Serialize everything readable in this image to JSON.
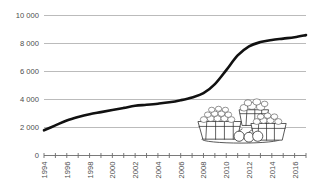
{
  "chart_data": {
    "type": "line",
    "title": "",
    "subtitle": "",
    "xlabel": "",
    "ylabel": "",
    "grid": true,
    "legend": "none",
    "xlim": [
      1994,
      2017
    ],
    "ylim": [
      0,
      10000
    ],
    "y_ticks": [
      0,
      2000,
      4000,
      6000,
      8000,
      10000
    ],
    "y_tick_labels": [
      "0",
      "2 000",
      "4 000",
      "6 000",
      "8 000",
      "10 000"
    ],
    "x_tick_labels": [
      "1994",
      "1996",
      "1998",
      "2000",
      "2002",
      "2004",
      "2006",
      "2008",
      "2010",
      "2012",
      "2014",
      "2016"
    ],
    "x_tick_years_all": [
      1994,
      1995,
      1996,
      1997,
      1998,
      1999,
      2000,
      2001,
      2002,
      2003,
      2004,
      2005,
      2006,
      2007,
      2008,
      2009,
      2010,
      2011,
      2012,
      2013,
      2014,
      2015,
      2016,
      2017
    ],
    "x": [
      1994,
      1995,
      1996,
      1997,
      1998,
      1999,
      2000,
      2001,
      2002,
      2003,
      2004,
      2005,
      2006,
      2007,
      2008,
      2009,
      2010,
      2011,
      2012,
      2013,
      2014,
      2015,
      2016,
      2017
    ],
    "values": [
      1800,
      2150,
      2500,
      2750,
      2950,
      3100,
      3250,
      3400,
      3550,
      3620,
      3700,
      3800,
      3950,
      4150,
      4450,
      5100,
      6100,
      7150,
      7800,
      8100,
      8250,
      8350,
      8450,
      8600
    ],
    "series": [
      {
        "name": "series-1",
        "color": "#111111",
        "values": [
          1800,
          2150,
          2500,
          2750,
          2950,
          3100,
          3250,
          3400,
          3550,
          3620,
          3700,
          3800,
          3950,
          4150,
          4450,
          5100,
          6100,
          7150,
          7800,
          8100,
          8250,
          8350,
          8450,
          8600
        ]
      }
    ],
    "colors": {
      "line": "#111111",
      "grid": "#a9a9a9",
      "axis": "#6b6b6b",
      "tick_text": "#4c4c4c",
      "background": "#ffffff"
    },
    "decoration": {
      "name": "fruit-baskets-illustration",
      "description": "line-art baskets of berries and fruit"
    }
  }
}
